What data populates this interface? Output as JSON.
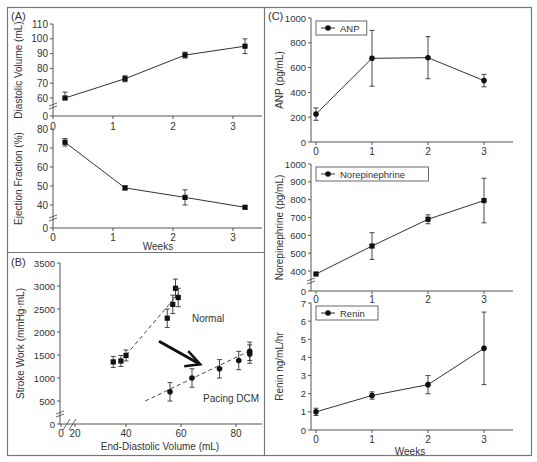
{
  "figure": {
    "panel_labels": {
      "A": "(A)",
      "B": "(B)",
      "C": "(C)"
    },
    "colors": {
      "line": "#333333",
      "marker": "#111111",
      "border": "#777777",
      "axis": "#555555",
      "arrow": "#111111",
      "text": "#333333"
    }
  },
  "chart_data": [
    {
      "id": "A-top",
      "type": "line",
      "panel": "A",
      "title": "",
      "xlabel": "",
      "ylabel": "Diastolic Volume (mL)",
      "x": [
        0.2,
        1.2,
        2.2,
        3.2
      ],
      "xticks": [
        0,
        1,
        2,
        3
      ],
      "yticks": [
        0,
        60,
        70,
        80,
        90,
        100,
        110
      ],
      "axis_break": true,
      "ylim": [
        0,
        110
      ],
      "series": [
        {
          "name": "Diastolic Volume",
          "values": [
            60,
            73,
            89,
            95
          ],
          "errors": [
            4,
            2,
            2,
            5
          ],
          "marker": "square"
        }
      ],
      "grid": false
    },
    {
      "id": "A-bottom",
      "type": "line",
      "panel": "A",
      "xlabel": "Weeks",
      "ylabel": "Ejection Fraction (%)",
      "x": [
        0.2,
        1.2,
        2.2,
        3.2
      ],
      "xticks": [
        0,
        1,
        2,
        3
      ],
      "yticks": [
        0,
        40,
        50,
        60,
        70,
        80
      ],
      "axis_break": true,
      "ylim": [
        0,
        80
      ],
      "series": [
        {
          "name": "Ejection Fraction",
          "values": [
            73,
            49,
            44,
            36
          ],
          "errors": [
            2,
            1,
            4,
            2
          ],
          "marker": "square"
        }
      ],
      "grid": false
    },
    {
      "id": "B",
      "type": "scatter",
      "panel": "B",
      "xlabel": "End-Diastolic Volume (mL)",
      "ylabel": "Stroke Work (mmHg·mL)",
      "xticks": [
        0,
        20,
        40,
        60,
        80
      ],
      "yticks": [
        0,
        500,
        1000,
        1500,
        2000,
        2500,
        3000,
        3500
      ],
      "axis_break": true,
      "xlim": [
        20,
        86
      ],
      "ylim": [
        0,
        3500
      ],
      "series": [
        {
          "name": "Normal",
          "x": [
            35,
            38,
            40,
            55,
            57,
            58,
            59
          ],
          "values": [
            1350,
            1370,
            1490,
            2300,
            2600,
            2950,
            2750
          ],
          "errors": [
            120,
            120,
            120,
            200,
            200,
            200,
            200
          ],
          "marker": "square",
          "fit_line": [
            [
              40,
              1500
            ],
            [
              60,
              2900
            ]
          ]
        },
        {
          "name": "Pacing DCM",
          "x": [
            56,
            64,
            74,
            81,
            85,
            85
          ],
          "values": [
            700,
            1000,
            1200,
            1380,
            1520,
            1580
          ],
          "errors": [
            200,
            200,
            200,
            200,
            200,
            200
          ],
          "marker": "circle",
          "fit_line": [
            [
              47,
              500
            ],
            [
              86,
              1620
            ]
          ]
        }
      ],
      "annotations": [
        {
          "text": "Normal",
          "x": 64,
          "y": 2220
        },
        {
          "text": "Pacing DCM",
          "x": 68,
          "y": 470
        },
        {
          "type": "arrow",
          "from": [
            52,
            1800
          ],
          "to": [
            67,
            1300
          ]
        }
      ],
      "grid": false
    },
    {
      "id": "C-top",
      "type": "line",
      "panel": "C",
      "xlabel": "",
      "ylabel": "ANP (pg/mL)",
      "x": [
        0,
        1,
        2,
        3
      ],
      "xticks": [
        0,
        1,
        2,
        3
      ],
      "yticks": [
        0,
        200,
        400,
        600,
        800,
        1000
      ],
      "ylim": [
        0,
        1000
      ],
      "legend": "ANP",
      "series": [
        {
          "name": "ANP",
          "values": [
            225,
            675,
            680,
            495
          ],
          "errors": [
            50,
            225,
            170,
            50
          ],
          "marker": "circle"
        }
      ],
      "grid": false
    },
    {
      "id": "C-middle",
      "type": "line",
      "panel": "C",
      "xlabel": "",
      "ylabel": "Norepinephrine (pg/mL)",
      "x": [
        0,
        1,
        2,
        3
      ],
      "xticks": [
        0,
        1,
        2,
        3
      ],
      "yticks": [
        0,
        400,
        500,
        600,
        700,
        800,
        900,
        1000
      ],
      "axis_break": true,
      "ylim": [
        0,
        1000
      ],
      "legend": "Norepinephrine",
      "series": [
        {
          "name": "Norepinephrine",
          "values": [
            340,
            540,
            690,
            795
          ],
          "errors": [
            10,
            75,
            25,
            125
          ],
          "marker": "square"
        }
      ],
      "grid": false
    },
    {
      "id": "C-bottom",
      "type": "line",
      "panel": "C",
      "xlabel": "Weeks",
      "ylabel": "Renin ng/mL/hr",
      "x": [
        0,
        1,
        2,
        3
      ],
      "xticks": [
        0,
        1,
        2,
        3
      ],
      "yticks": [
        0,
        1,
        2,
        3,
        4,
        5,
        6,
        7
      ],
      "ylim": [
        0,
        7
      ],
      "legend": "Renin",
      "series": [
        {
          "name": "Renin",
          "values": [
            1.0,
            1.9,
            2.5,
            4.5
          ],
          "errors": [
            0.2,
            0.2,
            0.5,
            2.0
          ],
          "marker": "circle"
        }
      ],
      "grid": false
    }
  ]
}
